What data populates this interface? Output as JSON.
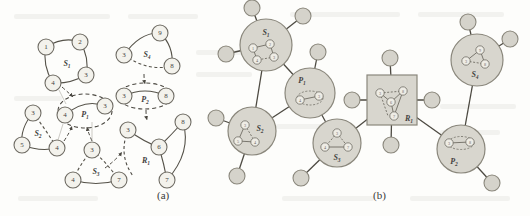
{
  "figure": {
    "panel_a_label": "(a)",
    "panel_b_label": "(b)"
  },
  "diagram_data": {
    "type": "diagram",
    "description": "Frequent subgraph patterns (a) and their hierarchical summarization graph (b)",
    "panel_a": {
      "patterns": [
        {
          "id": "S1",
          "label": "S",
          "subscript": "1",
          "shape": "solid",
          "nodes": [
            {
              "label": "1",
              "x": 46,
              "y": 47
            },
            {
              "label": "2",
              "x": 80,
              "y": 42
            },
            {
              "label": "3",
              "x": 86,
              "y": 75
            },
            {
              "label": "4",
              "x": 53,
              "y": 83
            }
          ],
          "edges": [
            [
              "1",
              "2"
            ],
            [
              "2",
              "3"
            ],
            [
              "3",
              "4"
            ],
            [
              "4",
              "1"
            ]
          ],
          "label_x": 67,
          "label_y": 63
        },
        {
          "id": "S2",
          "label": "S",
          "subscript": "2",
          "shape": "solid",
          "nodes": [
            {
              "label": "3",
              "x": 33,
              "y": 113
            },
            {
              "label": "5",
              "x": 22,
              "y": 145
            },
            {
              "label": "4",
              "x": 57,
              "y": 148
            }
          ],
          "edges": [
            [
              "3",
              "5"
            ],
            [
              "5",
              "4"
            ],
            [
              "3",
              "4"
            ]
          ],
          "label_x": 38,
          "label_y": 133
        },
        {
          "id": "S3",
          "label": "S",
          "subscript": "3",
          "shape": "solid",
          "nodes": [
            {
              "label": "3",
              "x": 92,
              "y": 150
            },
            {
              "label": "4",
              "x": 73,
              "y": 180
            },
            {
              "label": "7",
              "x": 119,
              "y": 180
            }
          ],
          "edges": [
            [
              "3",
              "4"
            ],
            [
              "3",
              "7"
            ],
            [
              "4",
              "7"
            ]
          ],
          "label_x": 96,
          "label_y": 171
        },
        {
          "id": "S4",
          "label": "S",
          "subscript": "4",
          "shape": "solid",
          "nodes": [
            {
              "label": "3",
              "x": 124,
              "y": 55
            },
            {
              "label": "9",
              "x": 160,
              "y": 33
            },
            {
              "label": "8",
              "x": 172,
              "y": 66
            }
          ],
          "edges": [
            [
              "3",
              "9"
            ],
            [
              "9",
              "8"
            ],
            [
              "3",
              "8"
            ]
          ],
          "label_x": 147,
          "label_y": 54
        },
        {
          "id": "P1",
          "label": "P",
          "subscript": "1",
          "shape": "dashed-ellipse",
          "nodes": [
            {
              "label": "4",
              "x": 65,
              "y": 115
            },
            {
              "label": "3",
              "x": 105,
              "y": 106
            }
          ],
          "edges": [
            [
              "4",
              "3"
            ]
          ],
          "label_x": 85,
          "label_y": 115
        },
        {
          "id": "P2",
          "label": "P",
          "subscript": "2",
          "shape": "dashed-ellipse",
          "nodes": [
            {
              "label": "3",
              "x": 124,
              "y": 96
            },
            {
              "label": "8",
              "x": 166,
              "y": 96
            }
          ],
          "edges": [
            [
              "3",
              "8"
            ]
          ],
          "label_x": 145,
          "label_y": 99
        },
        {
          "id": "R1",
          "label": "R",
          "subscript": "1",
          "shape": "dashed-region",
          "nodes": [
            {
              "label": "3",
              "x": 128,
              "y": 130
            },
            {
              "label": "8",
              "x": 183,
              "y": 122
            },
            {
              "label": "6",
              "x": 159,
              "y": 147
            },
            {
              "label": "7",
              "x": 167,
              "y": 180
            }
          ],
          "edges": [
            [
              "3",
              "6"
            ],
            [
              "6",
              "8"
            ],
            [
              "6",
              "7"
            ],
            [
              "8",
              "7"
            ]
          ],
          "label_x": 146,
          "label_y": 160
        }
      ],
      "mapping_arrows": [
        {
          "from": "S1",
          "to": "P1"
        },
        {
          "from": "S2",
          "to": "P1"
        },
        {
          "from": "S3",
          "to": "P1"
        },
        {
          "from": "S4",
          "to": "P2"
        },
        {
          "from": "P2",
          "to": "R1"
        },
        {
          "from": "S3",
          "to": "R1"
        }
      ]
    },
    "panel_b": {
      "clusters": [
        {
          "id": "S1",
          "label": "S",
          "subscript": "1",
          "shape": "circle",
          "cx": 266,
          "cy": 45,
          "r": 26,
          "label_dx": 0,
          "label_dy": -13,
          "inner_nodes": [
            {
              "label": "1",
              "x": -13,
              "y": 3
            },
            {
              "label": "2",
              "x": 4,
              "y": -1
            },
            {
              "label": "3",
              "x": 8,
              "y": 12
            },
            {
              "label": "4",
              "x": -9,
              "y": 15
            }
          ],
          "inner_edges": [
            [
              "1",
              "2"
            ],
            [
              "2",
              "3"
            ],
            [
              "3",
              "4"
            ],
            [
              "4",
              "1"
            ]
          ],
          "leaves": [
            {
              "x": 252,
              "y": 8,
              "r": 8
            },
            {
              "x": 303,
              "y": 16,
              "r": 8
            },
            {
              "x": 226,
              "y": 54,
              "r": 8
            }
          ]
        },
        {
          "id": "S2",
          "label": "S",
          "subscript": "2",
          "shape": "circle",
          "cx": 252,
          "cy": 131,
          "r": 24,
          "label_dx": 8,
          "label_dy": -3,
          "inner_nodes": [
            {
              "label": "3",
              "x": -7,
              "y": -6
            },
            {
              "label": "5",
              "x": -14,
              "y": 10
            },
            {
              "label": "4",
              "x": 3,
              "y": 11
            }
          ],
          "inner_edges": [
            [
              "3",
              "5"
            ],
            [
              "5",
              "4"
            ],
            [
              "3",
              "4"
            ]
          ],
          "leaves": [
            {
              "x": 216,
              "y": 118,
              "r": 8
            },
            {
              "x": 237,
              "y": 176,
              "r": 8
            }
          ]
        },
        {
          "id": "P1",
          "label": "P",
          "subscript": "1",
          "shape": "circle",
          "cx": 310,
          "cy": 93,
          "r": 25,
          "label_dx": -8,
          "label_dy": -13,
          "inner_nodes": [
            {
              "label": "4",
              "x": -10,
              "y": 7
            },
            {
              "label": "3",
              "x": 9,
              "y": 3
            }
          ],
          "inner_edges": [
            [
              "4",
              "3"
            ]
          ],
          "dashed_ring": true,
          "leaves": [
            {
              "x": 318,
              "y": 52,
              "r": 8
            }
          ]
        },
        {
          "id": "S3",
          "label": "S",
          "subscript": "3",
          "shape": "circle",
          "cx": 337,
          "cy": 143,
          "r": 24,
          "label_dx": 0,
          "label_dy": 14,
          "inner_nodes": [
            {
              "label": "3",
              "x": 0,
              "y": -10
            },
            {
              "label": "4",
              "x": -12,
              "y": 4
            },
            {
              "label": "7",
              "x": 11,
              "y": 4
            }
          ],
          "inner_edges": [
            [
              "3",
              "4"
            ],
            [
              "3",
              "7"
            ],
            [
              "4",
              "7"
            ]
          ],
          "leaves": [
            {
              "x": 301,
              "y": 178,
              "r": 8
            }
          ]
        },
        {
          "id": "R1",
          "label": "R",
          "subscript": "1",
          "shape": "square",
          "cx": 392,
          "cy": 100,
          "r": 25,
          "label_dx": 17,
          "label_dy": 15,
          "inner_nodes": [
            {
              "label": "3",
              "x": -12,
              "y": -7
            },
            {
              "label": "8",
              "x": 11,
              "y": -9
            },
            {
              "label": "6",
              "x": -1,
              "y": 2
            },
            {
              "label": "7",
              "x": 2,
              "y": 16
            }
          ],
          "inner_edges": [
            [
              "3",
              "6"
            ],
            [
              "6",
              "8"
            ],
            [
              "6",
              "7"
            ],
            [
              "8",
              "7"
            ]
          ],
          "leaves": [
            {
              "x": 390,
              "y": 58,
              "r": 8
            },
            {
              "x": 352,
              "y": 100,
              "r": 8
            },
            {
              "x": 432,
              "y": 100,
              "r": 8
            },
            {
              "x": 391,
              "y": 145,
              "r": 8
            }
          ]
        },
        {
          "id": "S4",
          "label": "S",
          "subscript": "4",
          "shape": "circle",
          "cx": 477,
          "cy": 60,
          "r": 26,
          "label_dx": -2,
          "label_dy": 14,
          "inner_nodes": [
            {
              "label": "3",
              "x": -11,
              "y": 1
            },
            {
              "label": "9",
              "x": 3,
              "y": -10
            },
            {
              "label": "8",
              "x": 8,
              "y": 4
            }
          ],
          "inner_edges": [
            [
              "3",
              "9"
            ],
            [
              "9",
              "8"
            ],
            [
              "3",
              "8"
            ]
          ],
          "leaves": [
            {
              "x": 468,
              "y": 22,
              "r": 8
            },
            {
              "x": 510,
              "y": 39,
              "r": 8
            }
          ]
        },
        {
          "id": "P2",
          "label": "P",
          "subscript": "2",
          "shape": "circle",
          "cx": 461,
          "cy": 149,
          "r": 24,
          "label_dx": -7,
          "label_dy": 12,
          "inner_nodes": [
            {
              "label": "3",
              "x": -12,
              "y": -6
            },
            {
              "label": "8",
              "x": 9,
              "y": -7
            }
          ],
          "inner_edges": [
            [
              "3",
              "8"
            ]
          ],
          "dashed_ring": true,
          "leaves": [
            {
              "x": 492,
              "y": 183,
              "r": 8
            }
          ]
        }
      ],
      "links": [
        [
          "S1",
          "P1"
        ],
        [
          "S2",
          "P1"
        ],
        [
          "P1",
          "S3"
        ],
        [
          "S3",
          "R1"
        ],
        [
          "R1",
          "P2"
        ],
        [
          "P2",
          "S4"
        ],
        [
          "S2",
          "S1"
        ]
      ]
    }
  },
  "colors": {
    "cluster_fill": "#d8d6ce",
    "cluster_stroke": "#8a877c",
    "node_fill": "#e7e5dd",
    "node_stroke": "#6e6b63",
    "edge": "#555249",
    "dashed": "#4a4740",
    "text": "#44423f",
    "background": "#fdfdfb"
  }
}
